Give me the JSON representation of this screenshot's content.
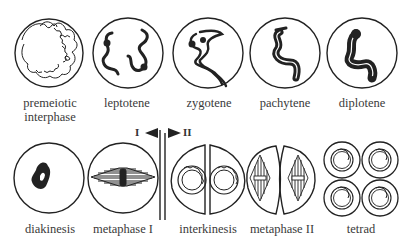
{
  "diagram": {
    "top_row": [
      {
        "label_line1": "premeiotic",
        "label_line2": "interphase"
      },
      {
        "label_line1": "leptotene"
      },
      {
        "label_line1": "zygotene"
      },
      {
        "label_line1": "pachytene"
      },
      {
        "label_line1": "diplotene"
      }
    ],
    "bottom_row": [
      {
        "label_line1": "diakinesis"
      },
      {
        "label_line1": "metaphase I"
      },
      {
        "label_line1": "interkinesis"
      },
      {
        "label_line1": "metaphase II"
      },
      {
        "label_line1": "tetrad"
      }
    ],
    "divider": {
      "left_label": "I",
      "right_label": "II"
    },
    "colors": {
      "stroke": "#222222",
      "background": "#ffffff"
    }
  }
}
